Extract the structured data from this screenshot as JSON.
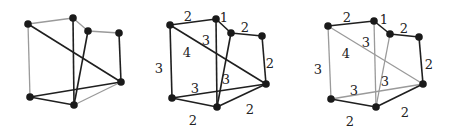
{
  "figure": {
    "colors": {
      "dark_edge": "#1f1f1f",
      "light_edge": "#9a9a9a",
      "node": "#1a1a1a",
      "label": "#222222"
    }
  },
  "nodes": [
    "A",
    "B",
    "C",
    "D",
    "E",
    "F",
    "G"
  ],
  "edges": [
    {
      "id": "AB",
      "from": "A",
      "to": "B",
      "weight": "2"
    },
    {
      "id": "BC",
      "from": "B",
      "to": "C",
      "weight": "1"
    },
    {
      "id": "CD",
      "from": "C",
      "to": "D",
      "weight": "2"
    },
    {
      "id": "DE",
      "from": "D",
      "to": "E",
      "weight": "2"
    },
    {
      "id": "AF",
      "from": "A",
      "to": "F",
      "weight": "3"
    },
    {
      "id": "AE",
      "from": "A",
      "to": "E",
      "weight": "4"
    },
    {
      "id": "BG",
      "from": "B",
      "to": "G",
      "weight": "3"
    },
    {
      "id": "CG",
      "from": "C",
      "to": "G",
      "weight": "3"
    },
    {
      "id": "FE",
      "from": "F",
      "to": "E",
      "weight": "3"
    },
    {
      "id": "FG",
      "from": "F",
      "to": "G",
      "weight": "2"
    },
    {
      "id": "GE",
      "from": "G",
      "to": "E",
      "weight": "2"
    }
  ],
  "panels": [
    {
      "name": "unweighted-graph",
      "positions": {
        "A": [
          28,
          24
        ],
        "B": [
          73,
          18
        ],
        "C": [
          88,
          31
        ],
        "D": [
          119,
          33
        ],
        "E": [
          121,
          82
        ],
        "F": [
          30,
          97
        ],
        "G": [
          74,
          105
        ]
      },
      "light_edges": [
        "AB",
        "BC",
        "CD",
        "AF",
        "GE"
      ],
      "show_weights": false
    },
    {
      "name": "weighted-graph",
      "positions": {
        "A": [
          170,
          25
        ],
        "B": [
          216,
          19
        ],
        "C": [
          231,
          33
        ],
        "D": [
          262,
          36
        ],
        "E": [
          266,
          84
        ],
        "F": [
          172,
          98
        ],
        "G": [
          217,
          107
        ]
      },
      "light_edges": [],
      "show_weights": true,
      "labels": [
        {
          "edge": "AB",
          "text": "2",
          "x": 188,
          "y": 16
        },
        {
          "edge": "BC",
          "text": "1",
          "x": 224,
          "y": 17
        },
        {
          "edge": "CD",
          "text": "2",
          "x": 245,
          "y": 27
        },
        {
          "edge": "BG",
          "text": "3",
          "x": 206,
          "y": 40
        },
        {
          "edge": "AE",
          "text": "4",
          "x": 187,
          "y": 52
        },
        {
          "edge": "DE",
          "text": "2",
          "x": 270,
          "y": 63
        },
        {
          "edge": "AF",
          "text": "3",
          "x": 159,
          "y": 68
        },
        {
          "edge": "CG",
          "text": "3",
          "x": 226,
          "y": 79
        },
        {
          "edge": "FE",
          "text": "3",
          "x": 195,
          "y": 88
        },
        {
          "edge": "GE",
          "text": "2",
          "x": 250,
          "y": 109
        },
        {
          "edge": "FG",
          "text": "2",
          "x": 193,
          "y": 120
        }
      ]
    },
    {
      "name": "minimum-spanning-tree",
      "positions": {
        "A": [
          328,
          26
        ],
        "B": [
          374,
          21
        ],
        "C": [
          390,
          34
        ],
        "D": [
          419,
          37
        ],
        "E": [
          423,
          84
        ],
        "F": [
          331,
          99
        ],
        "G": [
          376,
          107
        ]
      },
      "light_edges": [
        "AF",
        "AE",
        "BG",
        "CG",
        "FE"
      ],
      "show_weights": true,
      "labels": [
        {
          "edge": "AB",
          "text": "2",
          "x": 347,
          "y": 17
        },
        {
          "edge": "BC",
          "text": "1",
          "x": 384,
          "y": 19
        },
        {
          "edge": "CD",
          "text": "2",
          "x": 404,
          "y": 28
        },
        {
          "edge": "BG",
          "text": "3",
          "x": 366,
          "y": 42
        },
        {
          "edge": "AE",
          "text": "4",
          "x": 346,
          "y": 53
        },
        {
          "edge": "DE",
          "text": "2",
          "x": 429,
          "y": 64
        },
        {
          "edge": "AF",
          "text": "3",
          "x": 318,
          "y": 69
        },
        {
          "edge": "CG",
          "text": "3",
          "x": 385,
          "y": 81
        },
        {
          "edge": "FE",
          "text": "3",
          "x": 354,
          "y": 90
        },
        {
          "edge": "GE",
          "text": "2",
          "x": 405,
          "y": 112
        },
        {
          "edge": "FG",
          "text": "2",
          "x": 350,
          "y": 121
        }
      ]
    }
  ]
}
